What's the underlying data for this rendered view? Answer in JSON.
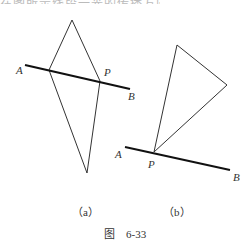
{
  "top_text": "在图所示线段一光的传播方向",
  "figure_a": {
    "label": "（a）",
    "points": {
      "A": "A",
      "P": "P",
      "B": "B"
    }
  },
  "figure_b": {
    "label": "（b）",
    "points": {
      "A": "A",
      "P": "P",
      "B": "B"
    }
  },
  "caption": "图　6-33",
  "colors": {
    "line": "#222222",
    "text": "#333333"
  }
}
